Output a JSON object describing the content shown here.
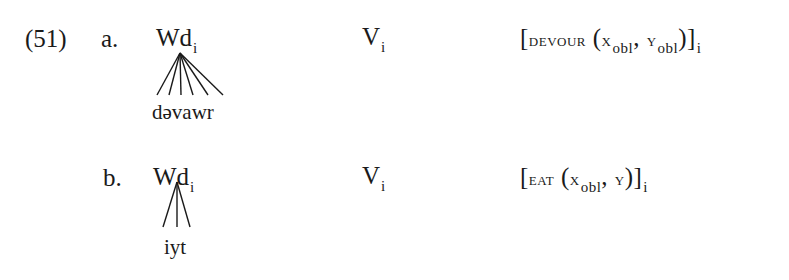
{
  "example": {
    "number": "(51)",
    "rows": [
      {
        "label": "a.",
        "node": "Wd",
        "node_index": "i",
        "leaf": "dəvawr",
        "branches": 6,
        "category": "V",
        "category_index": "i",
        "semantics": {
          "open": "[",
          "predicate": "devour",
          "args_open": "(",
          "arg1": "x",
          "arg1_sub": "obl",
          "comma": ",",
          "arg2": "y",
          "arg2_sub": "obl",
          "args_close": ")",
          "close": "]",
          "index": "i"
        }
      },
      {
        "label": "b.",
        "node": "Wd",
        "node_index": "i",
        "leaf": "iyt",
        "branches": 3,
        "category": "V",
        "category_index": "i",
        "semantics": {
          "open": "[",
          "predicate": "eat",
          "args_open": "(",
          "arg1": "x",
          "arg1_sub": "obl",
          "comma": ",",
          "arg2": "y",
          "args_close": ")",
          "close": "]",
          "index": "i"
        }
      }
    ]
  }
}
